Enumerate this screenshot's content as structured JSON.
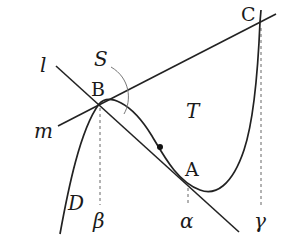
{
  "diagram": {
    "type": "math-figure",
    "labels": {
      "line_l": "l",
      "line_m": "m",
      "point_A": "A",
      "point_B": "B",
      "point_C": "C",
      "region_S": "S",
      "region_T": "T",
      "curve_D": "D",
      "x_alpha": "α",
      "x_beta": "β",
      "x_gamma": "γ"
    },
    "points": {
      "A": [
        188,
        180
      ],
      "B": [
        99,
        104
      ],
      "C": [
        260,
        22
      ],
      "marked_point": [
        160,
        147
      ]
    },
    "colors": {
      "stroke": "#222222",
      "dashed": "#666666",
      "arc": "#777777",
      "background": "#ffffff"
    }
  }
}
